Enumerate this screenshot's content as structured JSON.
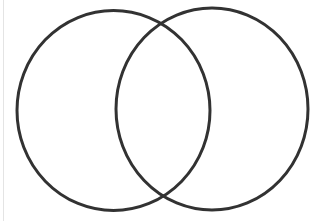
{
  "diagram": {
    "type": "venn",
    "set_count": 2,
    "labels": [],
    "stroke_color": "#333333",
    "background_color": "#ffffff",
    "border_color": "#e4e4e4",
    "circles": [
      {
        "name": "left-circle",
        "cx": 113.5,
        "cy": 110.5,
        "rx": 96.5,
        "ry": 100,
        "stroke_width": 3
      },
      {
        "name": "right-circle",
        "cx": 212,
        "cy": 109,
        "rx": 96,
        "ry": 101,
        "stroke_width": 3
      }
    ]
  }
}
